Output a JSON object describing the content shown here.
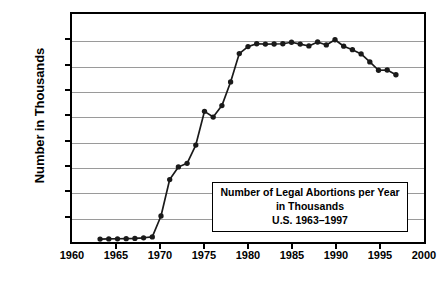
{
  "chart_data": {
    "type": "line",
    "title": "",
    "xlabel": "",
    "ylabel": "Number in Thousands",
    "xlim": [
      1960,
      2000
    ],
    "ylim": [
      0,
      1800
    ],
    "grid": true,
    "legend": "none",
    "marker": "filled-circle",
    "line_color": "#1a1a1a",
    "grid_color": "#9a9a9a",
    "axis_color": "#000000",
    "xticks": [
      1960,
      1965,
      1970,
      1975,
      1980,
      1985,
      1990,
      1995,
      2000
    ],
    "yticks": [
      0,
      200,
      400,
      600,
      800,
      1000,
      1200,
      1400,
      1600,
      1800
    ],
    "x": [
      1963,
      1964,
      1965,
      1966,
      1967,
      1968,
      1969,
      1970,
      1971,
      1972,
      1973,
      1974,
      1975,
      1976,
      1977,
      1978,
      1979,
      1980,
      1981,
      1982,
      1983,
      1984,
      1985,
      1986,
      1987,
      1988,
      1989,
      1990,
      1991,
      1992,
      1993,
      1994,
      1995,
      1996,
      1997
    ],
    "values": [
      8,
      9,
      10,
      11,
      13,
      18,
      25,
      193,
      486,
      587,
      616,
      763,
      1034,
      988,
      1080,
      1270,
      1498,
      1554,
      1577,
      1574,
      1575,
      1577,
      1589,
      1574,
      1559,
      1591,
      1567,
      1609,
      1557,
      1529,
      1495,
      1431,
      1364,
      1366,
      1328
    ],
    "annotation": {
      "line1": "Number of Legal Abortions per Year",
      "line2": "in Thousands",
      "line3": "U.S. 1963–1997"
    }
  }
}
